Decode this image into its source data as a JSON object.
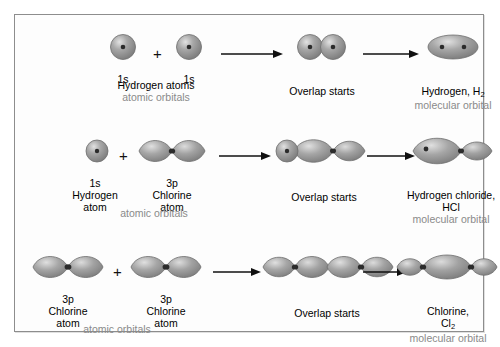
{
  "figure": {
    "background": "#fdfdfd",
    "border_color": "#8d8d8d",
    "orbital_fill": "#9a9a9a",
    "orbital_highlight": "#d8d8d8",
    "orbital_stroke": "#6f6f6f",
    "nucleus_color": "#2b2b2b",
    "text_color": "#000000",
    "muted_text_color": "#8a8a8a",
    "arrow_color": "#101010",
    "plus_symbol": "+"
  },
  "rows": [
    {
      "id": "hydrogen-row",
      "stages": [
        {
          "name": "reactant-left",
          "orbital_label": "1s",
          "lines": [
            "Hydrogen atoms"
          ],
          "muted_line": "atomic orbitals",
          "orbital_type": "s-sphere"
        },
        {
          "name": "reactant-right",
          "orbital_label": "1s",
          "lines": [],
          "muted_line": "",
          "orbital_type": "s-sphere"
        },
        {
          "name": "overlap",
          "orbital_label": "",
          "lines": [
            "Overlap starts"
          ],
          "muted_line": "",
          "orbital_type": "two-overlapping-spheres"
        },
        {
          "name": "product",
          "orbital_label": "",
          "lines": [
            "Hydrogen, H",
            "2"
          ],
          "muted_line": "molecular orbital",
          "orbital_type": "sigma-ellipse"
        }
      ]
    },
    {
      "id": "hydrogen-chloride-row",
      "stages": [
        {
          "name": "reactant-left",
          "orbital_label": "1s",
          "lines": [
            "Hydrogen",
            "atom"
          ],
          "muted_line": "atomic orbitals",
          "orbital_type": "s-sphere"
        },
        {
          "name": "reactant-right",
          "orbital_label": "3p",
          "lines": [
            "Chlorine",
            "atom"
          ],
          "muted_line": "",
          "orbital_type": "p-dumbbell"
        },
        {
          "name": "overlap",
          "orbital_label": "",
          "lines": [
            "Overlap starts"
          ],
          "muted_line": "",
          "orbital_type": "sphere-plus-dumbbell"
        },
        {
          "name": "product",
          "orbital_label": "",
          "lines": [
            "Hydrogen chloride,",
            "HCl"
          ],
          "muted_line": "molecular orbital",
          "orbital_type": "hcl-molecular"
        }
      ]
    },
    {
      "id": "chlorine-row",
      "stages": [
        {
          "name": "reactant-left",
          "orbital_label": "3p",
          "lines": [
            "Chlorine",
            "atom"
          ],
          "muted_line": "atomic orbitals",
          "orbital_type": "p-dumbbell"
        },
        {
          "name": "reactant-right",
          "orbital_label": "3p",
          "lines": [
            "Chlorine",
            "atom"
          ],
          "muted_line": "",
          "orbital_type": "p-dumbbell"
        },
        {
          "name": "overlap",
          "orbital_label": "",
          "lines": [
            "Overlap starts"
          ],
          "muted_line": "",
          "orbital_type": "two-dumbbells-touching"
        },
        {
          "name": "product",
          "orbital_label": "",
          "lines": [
            "Chlorine,",
            "Cl",
            "2"
          ],
          "muted_line": "molecular orbital",
          "orbital_type": "cl2-molecular"
        }
      ]
    }
  ]
}
